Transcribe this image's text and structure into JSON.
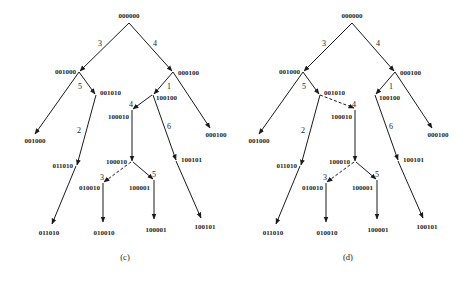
{
  "figure": {
    "panels": [
      {
        "id": "c",
        "caption": "(c)",
        "nodes": [
          {
            "key": "root",
            "label": "000000"
          },
          {
            "key": "n001000",
            "label": "001000"
          },
          {
            "key": "n000100",
            "label": "000100"
          },
          {
            "key": "n001010",
            "label": "001010"
          },
          {
            "key": "n100100",
            "label": "100100"
          },
          {
            "key": "n100010a",
            "label": "100010"
          },
          {
            "key": "leaf001000",
            "label": "001000"
          },
          {
            "key": "leaf000100",
            "label": "000100"
          },
          {
            "key": "n011010",
            "label": "011010"
          },
          {
            "key": "n100010b",
            "label": "100010"
          },
          {
            "key": "n100101",
            "label": "100101"
          },
          {
            "key": "n010010",
            "label": "010010"
          },
          {
            "key": "n100001",
            "label": "100001"
          },
          {
            "key": "leaf011010",
            "label": "011010"
          },
          {
            "key": "leaf010010",
            "label": "010010"
          },
          {
            "key": "leaf100001",
            "label": "100001"
          },
          {
            "key": "leaf100101",
            "label": "100101"
          }
        ],
        "edge_labels": [
          "3",
          "4",
          "5",
          "1",
          "4",
          "2",
          "6",
          "3",
          "5"
        ]
      },
      {
        "id": "d",
        "caption": "(d)",
        "nodes": [
          {
            "key": "root",
            "label": "000000"
          },
          {
            "key": "n001000",
            "label": "001000"
          },
          {
            "key": "n000100",
            "label": "000100"
          },
          {
            "key": "n001010",
            "label": "001010"
          },
          {
            "key": "n100100",
            "label": "100100"
          },
          {
            "key": "n100010a",
            "label": "100010"
          },
          {
            "key": "leaf001000",
            "label": "001000"
          },
          {
            "key": "leaf000100",
            "label": "000100"
          },
          {
            "key": "n011010",
            "label": "011010"
          },
          {
            "key": "n100010b",
            "label": "100010"
          },
          {
            "key": "n100101",
            "label": "100101"
          },
          {
            "key": "n010010",
            "label": "010010"
          },
          {
            "key": "n100001",
            "label": "100001"
          },
          {
            "key": "leaf011010",
            "label": "011010"
          },
          {
            "key": "leaf010010",
            "label": "010010"
          },
          {
            "key": "leaf100001",
            "label": "100001"
          },
          {
            "key": "leaf100101",
            "label": "100101"
          }
        ],
        "edge_labels": [
          "3",
          "4",
          "5",
          "1",
          "4",
          "2",
          "6",
          "3",
          "5"
        ]
      }
    ]
  }
}
